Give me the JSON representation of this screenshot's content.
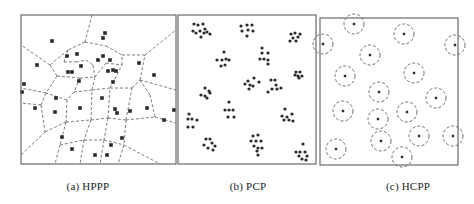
{
  "figure": {
    "colors": {
      "border": "#6a6a6a",
      "dash": "#6e6e6e",
      "point": "#2a2a2a",
      "background": "#ffffff"
    },
    "panels": [
      {
        "id": "a",
        "caption": "(a) HPPP",
        "caption_x": 88,
        "type": "voronoi",
        "frame": {
          "x": 21,
          "y": 15,
          "w": 155,
          "h": 149
        },
        "points": [
          [
            52,
            41
          ],
          [
            103,
            38
          ],
          [
            105,
            33
          ],
          [
            37,
            65
          ],
          [
            67,
            56
          ],
          [
            77,
            54
          ],
          [
            68,
            72
          ],
          [
            72,
            72
          ],
          [
            81,
            66
          ],
          [
            98,
            60
          ],
          [
            103,
            56
          ],
          [
            110,
            60
          ],
          [
            113,
            70
          ],
          [
            108,
            71
          ],
          [
            116,
            71
          ],
          [
            113,
            82
          ],
          [
            79,
            81
          ],
          [
            24,
            84
          ],
          [
            22,
            92
          ],
          [
            35,
            108
          ],
          [
            55,
            112
          ],
          [
            80,
            108
          ],
          [
            56,
            98
          ],
          [
            102,
            98
          ],
          [
            115,
            109
          ],
          [
            117,
            113
          ],
          [
            130,
            111
          ],
          [
            147,
            108
          ],
          [
            154,
            75
          ],
          [
            139,
            63
          ],
          [
            62,
            137
          ],
          [
            72,
            149
          ],
          [
            95,
            155
          ],
          [
            107,
            155
          ],
          [
            111,
            145
          ],
          [
            122,
            138
          ],
          [
            164,
            120
          ],
          [
            174,
            110
          ]
        ],
        "edges": [
          [
            [
              92,
              15
            ],
            [
              85,
              42
            ]
          ],
          [
            [
              85,
              42
            ],
            [
              68,
              50
            ]
          ],
          [
            [
              68,
              50
            ],
            [
              50,
              65
            ]
          ],
          [
            [
              50,
              65
            ],
            [
              21,
              45
            ]
          ],
          [
            [
              85,
              42
            ],
            [
              106,
              46
            ]
          ],
          [
            [
              106,
              46
            ],
            [
              122,
              55
            ]
          ],
          [
            [
              122,
              55
            ],
            [
              145,
              55
            ]
          ],
          [
            [
              145,
              55
            ],
            [
              176,
              30
            ]
          ],
          [
            [
              50,
              65
            ],
            [
              57,
              76
            ]
          ],
          [
            [
              57,
              76
            ],
            [
              80,
              78
            ]
          ],
          [
            [
              80,
              78
            ],
            [
              95,
              77
            ]
          ],
          [
            [
              95,
              77
            ],
            [
              106,
              63
            ]
          ],
          [
            [
              106,
              63
            ],
            [
              122,
              65
            ]
          ],
          [
            [
              122,
              65
            ],
            [
              122,
              55
            ]
          ],
          [
            [
              57,
              76
            ],
            [
              46,
              93
            ]
          ],
          [
            [
              46,
              93
            ],
            [
              21,
              88
            ]
          ],
          [
            [
              46,
              93
            ],
            [
              41,
              105
            ]
          ],
          [
            [
              41,
              105
            ],
            [
              21,
              103
            ]
          ],
          [
            [
              41,
              105
            ],
            [
              45,
              132
            ]
          ],
          [
            [
              45,
              132
            ],
            [
              21,
              155
            ]
          ],
          [
            [
              68,
              50
            ],
            [
              64,
              62
            ]
          ],
          [
            [
              64,
              62
            ],
            [
              76,
              62
            ]
          ],
          [
            [
              76,
              62
            ],
            [
              86,
              60
            ]
          ],
          [
            [
              86,
              60
            ],
            [
              93,
              65
            ]
          ],
          [
            [
              93,
              65
            ],
            [
              95,
              77
            ]
          ],
          [
            [
              80,
              78
            ],
            [
              74,
              92
            ]
          ],
          [
            [
              74,
              92
            ],
            [
              92,
              90
            ]
          ],
          [
            [
              92,
              90
            ],
            [
              95,
              77
            ]
          ],
          [
            [
              92,
              90
            ],
            [
              110,
              88
            ]
          ],
          [
            [
              110,
              88
            ],
            [
              122,
              65
            ]
          ],
          [
            [
              110,
              88
            ],
            [
              132,
              88
            ]
          ],
          [
            [
              132,
              88
            ],
            [
              140,
              80
            ]
          ],
          [
            [
              140,
              80
            ],
            [
              145,
              55
            ]
          ],
          [
            [
              140,
              80
            ],
            [
              176,
              90
            ]
          ],
          [
            [
              74,
              92
            ],
            [
              67,
              100
            ]
          ],
          [
            [
              67,
              100
            ],
            [
              46,
              93
            ]
          ],
          [
            [
              67,
              100
            ],
            [
              66,
              122
            ]
          ],
          [
            [
              66,
              122
            ],
            [
              45,
              132
            ]
          ],
          [
            [
              66,
              122
            ],
            [
              91,
              120
            ]
          ],
          [
            [
              91,
              120
            ],
            [
              92,
              90
            ]
          ],
          [
            [
              91,
              120
            ],
            [
              108,
              118
            ]
          ],
          [
            [
              108,
              118
            ],
            [
              110,
              88
            ]
          ],
          [
            [
              108,
              118
            ],
            [
              126,
              120
            ]
          ],
          [
            [
              126,
              120
            ],
            [
              132,
              88
            ]
          ],
          [
            [
              126,
              120
            ],
            [
              155,
              117
            ]
          ],
          [
            [
              155,
              117
            ],
            [
              176,
              123
            ]
          ],
          [
            [
              155,
              117
            ],
            [
              150,
              95
            ]
          ],
          [
            [
              150,
              95
            ],
            [
              140,
              80
            ]
          ],
          [
            [
              66,
              122
            ],
            [
              60,
              145
            ]
          ],
          [
            [
              60,
              145
            ],
            [
              55,
              164
            ]
          ],
          [
            [
              91,
              120
            ],
            [
              84,
              140
            ]
          ],
          [
            [
              84,
              140
            ],
            [
              80,
              164
            ]
          ],
          [
            [
              108,
              118
            ],
            [
              104,
              140
            ]
          ],
          [
            [
              104,
              140
            ],
            [
              100,
              164
            ]
          ],
          [
            [
              126,
              120
            ],
            [
              124,
              145
            ]
          ],
          [
            [
              124,
              145
            ],
            [
              118,
              164
            ]
          ],
          [
            [
              124,
              145
            ],
            [
              160,
              164
            ]
          ],
          [
            [
              60,
              145
            ],
            [
              84,
              140
            ]
          ],
          [
            [
              84,
              140
            ],
            [
              104,
              140
            ]
          ],
          [
            [
              104,
              140
            ],
            [
              124,
              145
            ]
          ]
        ]
      },
      {
        "id": "b",
        "caption": "(b) PCP",
        "caption_x": 248,
        "type": "cluster",
        "frame": {
          "x": 178,
          "y": 15,
          "w": 138,
          "h": 149
        },
        "points": [
          [
            194,
            24
          ],
          [
            198,
            25
          ],
          [
            203,
            24
          ],
          [
            205,
            29
          ],
          [
            193,
            31
          ],
          [
            196,
            33
          ],
          [
            200,
            31
          ],
          [
            204,
            33
          ],
          [
            207,
            32
          ],
          [
            210,
            34
          ],
          [
            201,
            37
          ],
          [
            241,
            26
          ],
          [
            247,
            25
          ],
          [
            252,
            25
          ],
          [
            242,
            31
          ],
          [
            248,
            30
          ],
          [
            253,
            31
          ],
          [
            247,
            36
          ],
          [
            291,
            34
          ],
          [
            295,
            33
          ],
          [
            300,
            34
          ],
          [
            293,
            38
          ],
          [
            298,
            37
          ],
          [
            290,
            41
          ],
          [
            296,
            41
          ],
          [
            224,
            52
          ],
          [
            217,
            60
          ],
          [
            222,
            60
          ],
          [
            226,
            59
          ],
          [
            229,
            60
          ],
          [
            221,
            66
          ],
          [
            225,
            65
          ],
          [
            262,
            48
          ],
          [
            262,
            53
          ],
          [
            268,
            53
          ],
          [
            260,
            59
          ],
          [
            264,
            59
          ],
          [
            268,
            60
          ],
          [
            268,
            64
          ],
          [
            296,
            72
          ],
          [
            300,
            72
          ],
          [
            295,
            75
          ],
          [
            298,
            76
          ],
          [
            302,
            76
          ],
          [
            299,
            78
          ],
          [
            248,
            81
          ],
          [
            254,
            78
          ],
          [
            259,
            82
          ],
          [
            245,
            84
          ],
          [
            250,
            85
          ],
          [
            253,
            86
          ],
          [
            249,
            89
          ],
          [
            271,
            80
          ],
          [
            275,
            80
          ],
          [
            276,
            85
          ],
          [
            272,
            89
          ],
          [
            277,
            89
          ],
          [
            281,
            88
          ],
          [
            268,
            92
          ],
          [
            205,
            88
          ],
          [
            209,
            91
          ],
          [
            210,
            93
          ],
          [
            201,
            95
          ],
          [
            205,
            96
          ],
          [
            207,
            98
          ],
          [
            229,
            102
          ],
          [
            225,
            110
          ],
          [
            229,
            110
          ],
          [
            233,
            110
          ],
          [
            228,
            117
          ],
          [
            234,
            117
          ],
          [
            189,
            114
          ],
          [
            188,
            119
          ],
          [
            192,
            119
          ],
          [
            197,
            120
          ],
          [
            188,
            127
          ],
          [
            193,
            127
          ],
          [
            285,
            109
          ],
          [
            282,
            116
          ],
          [
            287,
            117
          ],
          [
            292,
            114
          ],
          [
            284,
            120
          ],
          [
            289,
            120
          ],
          [
            293,
            121
          ],
          [
            206,
            139
          ],
          [
            210,
            139
          ],
          [
            212,
            143
          ],
          [
            204,
            145
          ],
          [
            215,
            146
          ],
          [
            208,
            148
          ],
          [
            213,
            150
          ],
          [
            253,
            136
          ],
          [
            258,
            135
          ],
          [
            251,
            141
          ],
          [
            256,
            141
          ],
          [
            261,
            141
          ],
          [
            254,
            146
          ],
          [
            258,
            148
          ],
          [
            262,
            148
          ],
          [
            257,
            151
          ],
          [
            258,
            155
          ],
          [
            303,
            144
          ],
          [
            296,
            152
          ],
          [
            300,
            152
          ],
          [
            305,
            152
          ],
          [
            299,
            156
          ],
          [
            307,
            156
          ],
          [
            302,
            159
          ],
          [
            306,
            160
          ]
        ]
      },
      {
        "id": "c",
        "caption": "(c) HCPP",
        "caption_x": 408,
        "type": "hardcore",
        "frame": {
          "x": 320,
          "y": 18,
          "w": 138,
          "h": 147
        },
        "radius": 10,
        "points": [
          [
            354,
            24
          ],
          [
            323,
            44
          ],
          [
            404,
            34
          ],
          [
            455,
            45
          ],
          [
            370,
            55
          ],
          [
            345,
            76
          ],
          [
            414,
            73
          ],
          [
            379,
            92
          ],
          [
            436,
            98
          ],
          [
            343,
            111
          ],
          [
            378,
            119
          ],
          [
            407,
            112
          ],
          [
            419,
            136
          ],
          [
            381,
            141
          ],
          [
            336,
            149
          ],
          [
            402,
            157
          ],
          [
            453,
            136
          ]
        ]
      }
    ]
  }
}
